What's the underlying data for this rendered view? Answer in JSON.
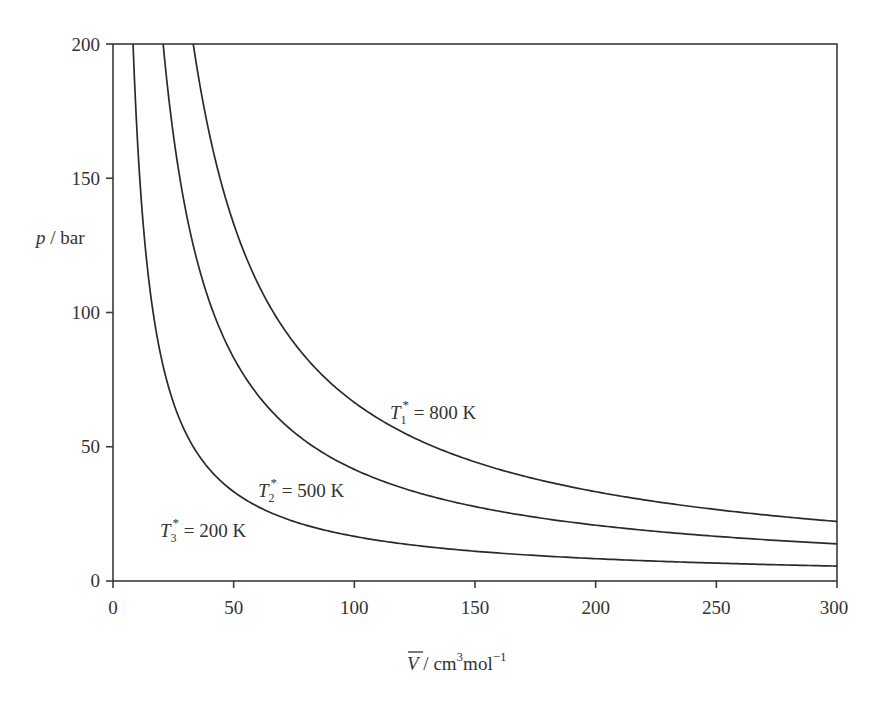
{
  "chart_data": {
    "type": "line",
    "title": "",
    "xlabel": "V̄ / cm³mol⁻¹",
    "ylabel": "p / bar",
    "xlim": [
      0,
      300
    ],
    "ylim": [
      0,
      200
    ],
    "xticks": [
      0,
      50,
      100,
      150,
      200,
      250,
      300
    ],
    "yticks": [
      0,
      50,
      100,
      150,
      200
    ],
    "grid": false,
    "legend": "inline labels next to curves",
    "relation": "p = 8.314·T / V̄ (ideal-gas isotherms)",
    "series": [
      {
        "name": "T1* = 800 K",
        "temperature_K": 800,
        "x": [
          33.3,
          40,
          50,
          75,
          100,
          150,
          200,
          250,
          300
        ],
        "y": [
          200,
          166.3,
          133.0,
          88.7,
          66.5,
          44.3,
          33.3,
          26.6,
          22.2
        ]
      },
      {
        "name": "T2* = 500 K",
        "temperature_K": 500,
        "x": [
          20.8,
          25,
          50,
          75,
          100,
          150,
          200,
          250,
          300
        ],
        "y": [
          200,
          166.3,
          83.1,
          55.4,
          41.6,
          27.7,
          20.8,
          16.6,
          13.9
        ]
      },
      {
        "name": "T3* = 200 K",
        "temperature_K": 200,
        "x": [
          8.3,
          10,
          25,
          50,
          75,
          100,
          150,
          200,
          250,
          300
        ],
        "y": [
          200,
          166.3,
          66.5,
          33.3,
          22.2,
          16.6,
          11.1,
          8.3,
          6.7,
          5.5
        ]
      }
    ],
    "annotations": [
      {
        "symbol": "T",
        "subscript": "1",
        "superscript": "*",
        "text": " = 800 K",
        "near_x": 118,
        "near_y": 62
      },
      {
        "symbol": "T",
        "subscript": "2",
        "superscript": "*",
        "text": " = 500 K",
        "near_x": 60,
        "near_y": 31
      },
      {
        "symbol": "T",
        "subscript": "3",
        "superscript": "*",
        "text": " = 200 K",
        "near_x": 20,
        "near_y": 16
      }
    ]
  },
  "axes": {
    "x_ticks": [
      "0",
      "50",
      "100",
      "150",
      "200",
      "250",
      "300"
    ],
    "y_ticks": [
      "0",
      "50",
      "100",
      "150",
      "200"
    ],
    "x_label": {
      "symbol": "V",
      "rest": " / cm",
      "sup1": "3",
      "mid": "mol",
      "sup2": "−1"
    },
    "y_label": {
      "symbol": "p",
      "rest": " / bar"
    }
  },
  "labels": [
    {
      "symbol": "T",
      "sub": "1",
      "sup": "*",
      "rest": " = 800 K"
    },
    {
      "symbol": "T",
      "sub": "2",
      "sup": "*",
      "rest": " = 500 K"
    },
    {
      "symbol": "T",
      "sub": "3",
      "sup": "*",
      "rest": " = 200 K"
    }
  ],
  "style": {
    "line_color": "#2a2a2a",
    "axis_color": "#3a3a3a",
    "text_color": "#333333",
    "background": "#ffffff"
  }
}
